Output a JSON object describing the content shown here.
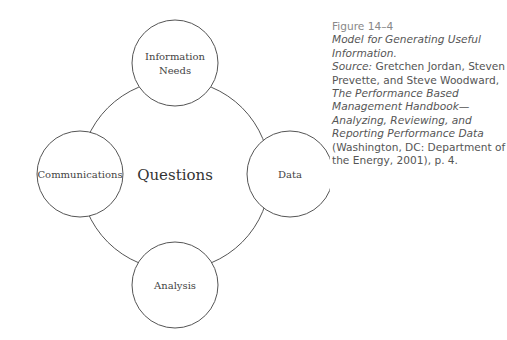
{
  "diagram": {
    "center": {
      "label": "Questions"
    },
    "nodes": [
      {
        "id": "top",
        "lines": [
          "Information",
          "Needs"
        ]
      },
      {
        "id": "right",
        "lines": [
          "Data"
        ]
      },
      {
        "id": "bottom",
        "lines": [
          "Analysis"
        ]
      },
      {
        "id": "left",
        "lines": [
          "Communications"
        ]
      }
    ]
  },
  "caption": {
    "figure_number": "Figure 14–4",
    "title": "Model for Generating Useful Information.",
    "source_label": "Source:",
    "authors": " Gretchen Jordan, Steven Prevette, and Steve Woodward, ",
    "book_title": "The Performance Based Management Handbook—Analyzing, Reviewing, and Reporting Performance Data",
    "publication": " (Washington, DC: Department of the Energy, 2001), p. 4."
  }
}
